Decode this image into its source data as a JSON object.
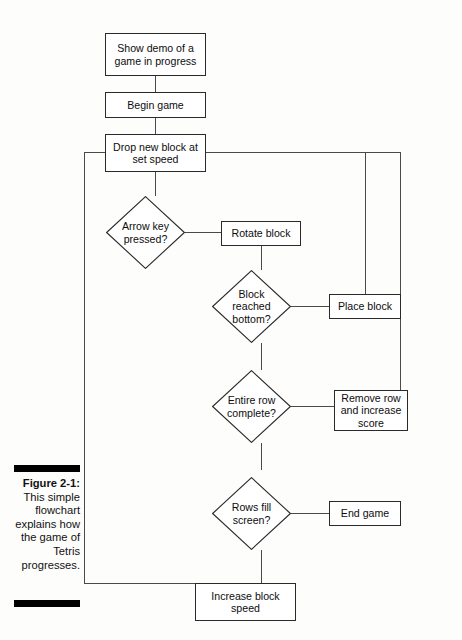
{
  "figure": {
    "number": "Figure 2-1:",
    "caption": "This simple flowchart explains how the game of Tetris progresses."
  },
  "flowchart": {
    "title": "Tetris game loop flowchart",
    "nodes": [
      {
        "id": "show-demo",
        "type": "process",
        "label": "Show demo of a game in progress"
      },
      {
        "id": "begin-game",
        "type": "process",
        "label": "Begin game"
      },
      {
        "id": "drop-block",
        "type": "process",
        "label": "Drop new block at set speed"
      },
      {
        "id": "arrow-key",
        "type": "decision",
        "label": "Arrow key pressed?"
      },
      {
        "id": "rotate-block",
        "type": "process",
        "label": "Rotate block"
      },
      {
        "id": "block-bottom",
        "type": "decision",
        "label": "Block reached bottom?"
      },
      {
        "id": "place-block",
        "type": "process",
        "label": "Place block"
      },
      {
        "id": "row-complete",
        "type": "decision",
        "label": "Entire row complete?"
      },
      {
        "id": "remove-row",
        "type": "process",
        "label": "Remove row and increase score"
      },
      {
        "id": "rows-fill",
        "type": "decision",
        "label": "Rows fill screen?"
      },
      {
        "id": "end-game",
        "type": "process",
        "label": "End game"
      },
      {
        "id": "increase-speed",
        "type": "process",
        "label": "Increase block speed"
      }
    ],
    "edges": [
      {
        "from": "show-demo",
        "to": "begin-game"
      },
      {
        "from": "begin-game",
        "to": "drop-block"
      },
      {
        "from": "drop-block",
        "to": "arrow-key"
      },
      {
        "from": "arrow-key",
        "to": "rotate-block"
      },
      {
        "from": "rotate-block",
        "to": "block-bottom"
      },
      {
        "from": "block-bottom",
        "to": "place-block"
      },
      {
        "from": "place-block",
        "to": "drop-block"
      },
      {
        "from": "block-bottom",
        "to": "row-complete"
      },
      {
        "from": "row-complete",
        "to": "remove-row"
      },
      {
        "from": "remove-row",
        "to": "drop-block"
      },
      {
        "from": "row-complete",
        "to": "rows-fill"
      },
      {
        "from": "rows-fill",
        "to": "end-game"
      },
      {
        "from": "rows-fill",
        "to": "increase-speed"
      },
      {
        "from": "increase-speed",
        "to": "drop-block"
      }
    ]
  },
  "colors": {
    "stroke": "#2a2a2a",
    "connector": "#4a4a4a",
    "paper": "#fdfdfc",
    "bar": "#000000"
  }
}
